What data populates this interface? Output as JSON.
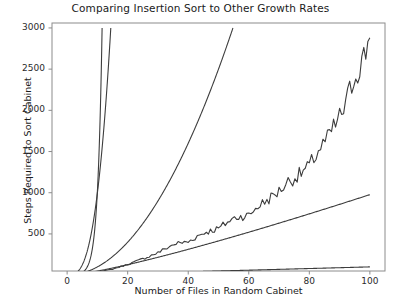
{
  "chart_data": {
    "type": "line",
    "title": "Comparing Insertion Sort to Other Growth Rates",
    "xlabel": "Number of Files in Random Cabinet",
    "ylabel": "Steps Required to Sort Cabinet",
    "xlim": [
      -5,
      105
    ],
    "ylim": [
      50,
      3060
    ],
    "xticks": [
      0,
      20,
      40,
      60,
      80,
      100
    ],
    "xtick_labels": [
      "0",
      "20",
      "40",
      "60",
      "80",
      "100"
    ],
    "yticks": [
      500,
      1000,
      1500,
      2000,
      2500,
      3000
    ],
    "ytick_labels": [
      "500",
      "1000",
      "1500",
      "2000",
      "2500",
      "3000"
    ],
    "grid": false,
    "legend": "none",
    "line_color": "#3d3d3d",
    "axis_color": "#8c8c8c",
    "background": "#ffffff",
    "series": [
      {
        "name": "2^n",
        "kind": "exponential",
        "formula": "2^n",
        "x": [
          0,
          1,
          2,
          3,
          4,
          5,
          6,
          7,
          8,
          9,
          10,
          11,
          11.55
        ],
        "values": [
          1,
          2,
          4,
          8,
          16,
          32,
          64,
          128,
          256,
          512,
          1024,
          2048,
          3000
        ]
      },
      {
        "name": "n^3",
        "kind": "cubic",
        "formula": "n^3",
        "x": [
          0,
          2,
          4,
          6,
          8,
          10,
          12,
          13,
          14,
          14.42
        ],
        "values": [
          0,
          8,
          64,
          216,
          512,
          1000,
          1728,
          2197,
          2744,
          3000
        ]
      },
      {
        "name": "n^2",
        "kind": "quadratic",
        "formula": "n^2",
        "x": [
          0,
          5,
          10,
          15,
          20,
          25,
          30,
          35,
          40,
          45,
          50,
          54.77
        ],
        "values": [
          0,
          25,
          100,
          225,
          400,
          625,
          900,
          1225,
          1600,
          2025,
          2500,
          3000
        ]
      },
      {
        "name": "insertion sort (measured)",
        "kind": "noisy",
        "formula": "empirical insertion sort step counts (~n^2/3.5 with noise)",
        "x": [
          0,
          5,
          10,
          15,
          20,
          25,
          30,
          33,
          36,
          40,
          43,
          46,
          50,
          53,
          56,
          60,
          63,
          66,
          70,
          73,
          76,
          80,
          83,
          86,
          90,
          92,
          94,
          96,
          98,
          100
        ],
        "values": [
          2,
          12,
          34,
          72,
          128,
          196,
          270,
          330,
          382,
          400,
          470,
          520,
          560,
          640,
          700,
          720,
          830,
          900,
          1010,
          1130,
          1190,
          1310,
          1500,
          1640,
          1900,
          2040,
          2300,
          2480,
          2620,
          2880
        ]
      },
      {
        "name": "n*log(n)",
        "kind": "linearithmic",
        "formula": "n log2(n) scaled",
        "x": [
          0,
          10,
          20,
          30,
          40,
          50,
          60,
          70,
          80,
          90,
          100
        ],
        "values": [
          0,
          45,
          125,
          215,
          310,
          415,
          520,
          630,
          745,
          860,
          975
        ]
      },
      {
        "name": "n",
        "kind": "linear",
        "formula": "n",
        "x": [
          0,
          20,
          40,
          60,
          80,
          100
        ],
        "values": [
          0,
          20,
          40,
          60,
          80,
          100
        ]
      }
    ]
  }
}
